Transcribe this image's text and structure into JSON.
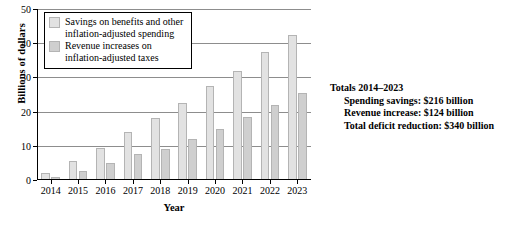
{
  "chart_data": {
    "type": "bar",
    "title": "",
    "xlabel": "Year",
    "ylabel": "Billions of dollars",
    "categories": [
      "2014",
      "2015",
      "2016",
      "2017",
      "2018",
      "2019",
      "2020",
      "2021",
      "2022",
      "2023"
    ],
    "ylim": [
      0,
      50
    ],
    "yticks": [
      0,
      10,
      20,
      30,
      40,
      50
    ],
    "grid": true,
    "legend_position": "top-left",
    "series": [
      {
        "name": "Savings on benefits and other\ninflation-adjusted spending",
        "color": "#e2e2e2",
        "values": [
          2,
          5.5,
          9.5,
          14,
          18,
          22.5,
          27.5,
          32,
          37.5,
          42.5
        ]
      },
      {
        "name": "Revenue increases on\ninflation-adjusted taxes",
        "color": "#cfcfcf",
        "values": [
          1,
          2.5,
          5,
          7.5,
          9,
          12,
          15,
          18.5,
          22,
          25.5
        ]
      }
    ]
  },
  "legend": {
    "items": [
      {
        "label": "Savings on benefits and other\ninflation-adjusted spending"
      },
      {
        "label": "Revenue increases on\ninflation-adjusted taxes"
      }
    ]
  },
  "totals": {
    "heading": "Totals 2014–2023",
    "lines": [
      "Spending savings: $216 billion",
      "Revenue increase: $124 billion",
      "Total deficit reduction: $340 billion"
    ]
  }
}
